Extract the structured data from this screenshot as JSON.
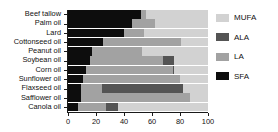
{
  "chart_data": {
    "type": "bar",
    "orientation": "horizontal",
    "stacked": true,
    "title": "",
    "xlabel": "",
    "ylabel": "",
    "xlim": [
      0,
      100
    ],
    "grid": false,
    "legend_position": "right",
    "categories": [
      "Beef tallow",
      "Palm oil",
      "Lard",
      "Cottonseed oil",
      "Peanut oil",
      "Soybean oil",
      "Corn oil",
      "Sunflower oil",
      "Flaxseed oil",
      "Safflower oil",
      "Canola oil"
    ],
    "xticks": [
      0,
      20,
      40,
      60,
      80,
      100
    ],
    "series": [
      {
        "name": "SFA",
        "color": "#0d0d0d",
        "values": [
          52,
          46,
          40,
          25,
          17,
          16,
          13,
          11,
          9,
          9,
          7
        ]
      },
      {
        "name": "LA",
        "color": "#a2a2a2",
        "values": [
          4,
          16,
          14,
          56,
          36,
          52,
          62,
          69,
          15,
          78,
          20
        ]
      },
      {
        "name": "ALA",
        "color": "#545454",
        "values": [
          0,
          0,
          0,
          0,
          0,
          8,
          1,
          0,
          58,
          0,
          9
        ]
      },
      {
        "name": "MUFA",
        "color": "#d2d2d2",
        "values": [
          44,
          38,
          46,
          19,
          47,
          24,
          24,
          20,
          18,
          13,
          64
        ]
      }
    ],
    "legend_entries": [
      {
        "label": "MUFA",
        "color": "#d2d2d2"
      },
      {
        "label": "ALA",
        "color": "#545454"
      },
      {
        "label": "LA",
        "color": "#a2a2a2"
      },
      {
        "label": "SFA",
        "color": "#0d0d0d"
      }
    ],
    "stack_order": [
      "SFA",
      "LA",
      "ALA",
      "MUFA"
    ]
  }
}
